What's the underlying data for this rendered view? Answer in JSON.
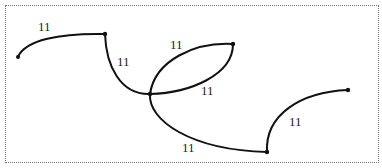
{
  "diagram": {
    "type": "graph",
    "nodes": [
      {
        "id": "A",
        "x": 18,
        "y": 57
      },
      {
        "id": "B",
        "x": 105,
        "y": 34
      },
      {
        "id": "C",
        "x": 150,
        "y": 94
      },
      {
        "id": "D",
        "x": 233,
        "y": 44
      },
      {
        "id": "E",
        "x": 267,
        "y": 152
      },
      {
        "id": "F",
        "x": 348,
        "y": 90
      }
    ],
    "edges": [
      {
        "from": "A",
        "to": "B",
        "label": "11"
      },
      {
        "from": "B",
        "to": "C",
        "label": "11"
      },
      {
        "from": "C",
        "to": "D",
        "label": "11",
        "side": "upper"
      },
      {
        "from": "C",
        "to": "D",
        "label": "11",
        "side": "lower"
      },
      {
        "from": "C",
        "to": "E",
        "label": "11"
      },
      {
        "from": "E",
        "to": "F",
        "label": "11"
      }
    ],
    "labels": {
      "ab": "11",
      "bc": "11",
      "cd_upper": "11",
      "cd_lower": "11",
      "ce": "11",
      "ef": "11"
    }
  }
}
